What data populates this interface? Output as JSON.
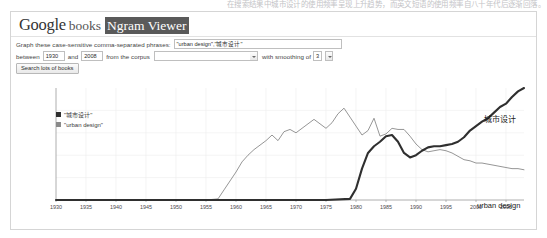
{
  "top_strip_text": "在搜索结果中城市设计的使用频率呈现上升趋势，而英文短语的使用频率自八十年代后逐渐回落。",
  "masthead": {
    "google": "Google",
    "books": "books",
    "ngram_viewer": "Ngram Viewer"
  },
  "form": {
    "phrases_label": "Graph these case-sensitive comma-separated phrases:",
    "phrases_value": "\"urban design\",\"城市设计\"",
    "phrases_placeholder": "",
    "between_label": "between",
    "start_year": "1930",
    "and_label": "and",
    "end_year": "2008",
    "corpus_label": "from the corpus",
    "corpus_value": "",
    "corpus_placeholder": "",
    "smoothing_label": "with smoothing of",
    "smoothing_value": "3",
    "search_button": "Search lots of books"
  },
  "chart_data": {
    "type": "line",
    "title": "",
    "xlabel": "",
    "ylabel": "",
    "xlim": [
      1930,
      2008
    ],
    "ylim": [
      0,
      1
    ],
    "grid": true,
    "legend_position": "top-left",
    "x_ticks": [
      "1930",
      "1935",
      "1940",
      "1945",
      "1950",
      "1955",
      "1960",
      "1965",
      "1970",
      "1975",
      "1980",
      "1985",
      "1990",
      "1995",
      "2000",
      "2005"
    ],
    "legend": [
      {
        "label": "\"城市设计\"",
        "color": "#2f2f2f"
      },
      {
        "label": "\"urban design\"",
        "color": "#8a8a8a"
      }
    ],
    "end_labels": [
      {
        "text": "城市设计",
        "series": "chinese"
      },
      {
        "text": "urban design",
        "series": "english"
      }
    ],
    "series": [
      {
        "name": "urban design",
        "color": "#8a8a8a",
        "x": [
          1930,
          1935,
          1940,
          1945,
          1950,
          1955,
          1957,
          1958,
          1959,
          1960,
          1961,
          1962,
          1963,
          1964,
          1965,
          1966,
          1967,
          1968,
          1969,
          1970,
          1971,
          1972,
          1973,
          1974,
          1975,
          1976,
          1977,
          1978,
          1979,
          1980,
          1981,
          1982,
          1983,
          1984,
          1985,
          1986,
          1987,
          1988,
          1989,
          1990,
          1991,
          1992,
          1993,
          1994,
          1995,
          1996,
          1997,
          1998,
          1999,
          2000,
          2001,
          2002,
          2003,
          2004,
          2005,
          2006,
          2007,
          2008
        ],
        "values": [
          0.0,
          0.0,
          0.0,
          0.0,
          0.0,
          0.0,
          0.01,
          0.09,
          0.17,
          0.25,
          0.34,
          0.4,
          0.45,
          0.49,
          0.53,
          0.58,
          0.53,
          0.61,
          0.63,
          0.6,
          0.64,
          0.68,
          0.72,
          0.68,
          0.64,
          0.69,
          0.77,
          0.82,
          0.74,
          0.66,
          0.58,
          0.62,
          0.73,
          0.57,
          0.59,
          0.64,
          0.63,
          0.63,
          0.57,
          0.5,
          0.45,
          0.43,
          0.44,
          0.45,
          0.44,
          0.42,
          0.39,
          0.36,
          0.35,
          0.33,
          0.33,
          0.32,
          0.31,
          0.3,
          0.29,
          0.28,
          0.28,
          0.27
        ]
      },
      {
        "name": "城市设计",
        "color": "#2f2f2f",
        "x": [
          1930,
          1940,
          1950,
          1960,
          1970,
          1975,
          1979,
          1980,
          1981,
          1982,
          1983,
          1984,
          1985,
          1986,
          1987,
          1988,
          1989,
          1990,
          1991,
          1992,
          1993,
          1994,
          1995,
          1996,
          1997,
          1998,
          1999,
          2000,
          2001,
          2002,
          2003,
          2004,
          2005,
          2006,
          2007,
          2008
        ],
        "values": [
          0.0,
          0.0,
          0.0,
          0.0,
          0.0,
          0.0,
          0.01,
          0.1,
          0.28,
          0.42,
          0.48,
          0.52,
          0.57,
          0.58,
          0.52,
          0.42,
          0.38,
          0.4,
          0.44,
          0.47,
          0.48,
          0.48,
          0.49,
          0.5,
          0.52,
          0.56,
          0.62,
          0.66,
          0.7,
          0.73,
          0.78,
          0.83,
          0.86,
          0.92,
          0.97,
          1.0
        ]
      }
    ]
  }
}
